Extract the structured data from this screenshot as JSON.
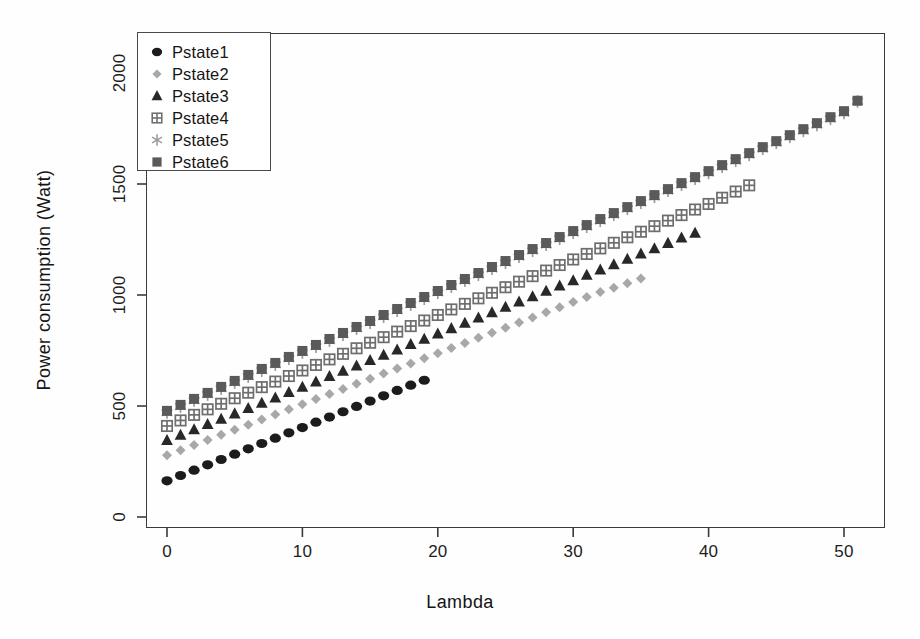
{
  "chart_data": {
    "type": "scatter",
    "title": "",
    "xlabel": "Lambda",
    "ylabel": "Power consumption (Watt)",
    "xlim": [
      -1.8,
      53.8
    ],
    "ylim": [
      -55,
      2105
    ],
    "xticks": [
      0,
      10,
      20,
      30,
      40,
      50
    ],
    "yticks": [
      0,
      500,
      1000,
      1500,
      2000
    ],
    "grid": false,
    "legend_position": "top-left",
    "series": [
      {
        "name": "Pstate1",
        "marker": "filled-circle",
        "color": "#1c1c1c",
        "x": [
          0,
          1,
          2,
          3,
          4,
          5,
          6,
          7,
          8,
          9,
          10,
          11,
          12,
          13,
          14,
          15,
          16,
          17,
          18,
          19
        ],
        "y": [
          163,
          187,
          211,
          235,
          259,
          283,
          307,
          331,
          355,
          379,
          403,
          427,
          450,
          474,
          498,
          522,
          546,
          570,
          594,
          616
        ]
      },
      {
        "name": "Pstate2",
        "marker": "filled-diamond",
        "color": "#a8a8a8",
        "x": [
          0,
          1,
          2,
          3,
          4,
          5,
          6,
          7,
          8,
          9,
          10,
          11,
          12,
          13,
          14,
          15,
          16,
          17,
          18,
          19,
          20,
          21,
          22,
          23,
          24,
          25,
          26,
          27,
          28,
          29,
          30,
          31,
          32,
          33,
          34,
          35
        ],
        "y": [
          278,
          301,
          324,
          347,
          370,
          393,
          416,
          439,
          462,
          485,
          508,
          531,
          554,
          577,
          600,
          623,
          646,
          669,
          692,
          715,
          738,
          761,
          784,
          807,
          830,
          853,
          876,
          899,
          922,
          945,
          968,
          991,
          1014,
          1033,
          1053,
          1074
        ]
      },
      {
        "name": "Pstate3",
        "marker": "filled-triangle",
        "color": "#282828",
        "x": [
          0,
          1,
          2,
          3,
          4,
          5,
          6,
          7,
          8,
          9,
          10,
          11,
          12,
          13,
          14,
          15,
          16,
          17,
          18,
          19,
          20,
          21,
          22,
          23,
          24,
          25,
          26,
          27,
          28,
          29,
          30,
          31,
          32,
          33,
          34,
          35,
          36,
          37,
          38,
          39
        ],
        "y": [
          345,
          369,
          393,
          417,
          441,
          465,
          489,
          513,
          537,
          561,
          585,
          609,
          633,
          657,
          681,
          705,
          729,
          753,
          777,
          801,
          825,
          849,
          873,
          897,
          921,
          945,
          969,
          993,
          1017,
          1041,
          1065,
          1089,
          1113,
          1137,
          1161,
          1185,
          1209,
          1233,
          1257,
          1279
        ]
      },
      {
        "name": "Pstate4",
        "marker": "squared-plus",
        "color": "#6e6e6e",
        "x": [
          0,
          1,
          2,
          3,
          4,
          5,
          6,
          7,
          8,
          9,
          10,
          11,
          12,
          13,
          14,
          15,
          16,
          17,
          18,
          19,
          20,
          21,
          22,
          23,
          24,
          25,
          26,
          27,
          28,
          29,
          30,
          31,
          32,
          33,
          34,
          35,
          36,
          37,
          38,
          39,
          40,
          41,
          42,
          43
        ],
        "y": [
          410,
          435,
          460,
          485,
          510,
          535,
          560,
          585,
          610,
          635,
          660,
          685,
          710,
          735,
          760,
          785,
          810,
          835,
          860,
          885,
          910,
          935,
          960,
          985,
          1010,
          1035,
          1060,
          1085,
          1110,
          1135,
          1160,
          1185,
          1210,
          1235,
          1260,
          1285,
          1310,
          1335,
          1360,
          1385,
          1410,
          1438,
          1466,
          1494
        ]
      },
      {
        "name": "Pstate5",
        "marker": "asterisk",
        "color": "#9c9c9c",
        "x": [
          0,
          1,
          2,
          3,
          4,
          5,
          6,
          7,
          8,
          9,
          10,
          11,
          12,
          13,
          14,
          15,
          16,
          17,
          18,
          19,
          20,
          21,
          22,
          23,
          24,
          25,
          26,
          27,
          28,
          29,
          30,
          31,
          32,
          33,
          34,
          35,
          36,
          37,
          38,
          39,
          40,
          41,
          42,
          43,
          44,
          45,
          46,
          47,
          48,
          49,
          50,
          51
        ],
        "y": [
          470,
          497,
          524,
          551,
          578,
          605,
          632,
          659,
          686,
          713,
          740,
          767,
          794,
          821,
          848,
          875,
          902,
          929,
          956,
          983,
          1010,
          1037,
          1064,
          1091,
          1118,
          1145,
          1172,
          1199,
          1226,
          1253,
          1280,
          1307,
          1334,
          1361,
          1388,
          1415,
          1442,
          1469,
          1496,
          1523,
          1550,
          1577,
          1604,
          1631,
          1658,
          1685,
          1712,
          1739,
          1766,
          1793,
          1820,
          1872
        ]
      },
      {
        "name": "Pstate6",
        "marker": "filled-square",
        "color": "#5a5a5a",
        "x": [
          0,
          1,
          2,
          3,
          4,
          5,
          6,
          7,
          8,
          9,
          10,
          11,
          12,
          13,
          14,
          15,
          16,
          17,
          18,
          19,
          20,
          21,
          22,
          23,
          24,
          25,
          26,
          27,
          28,
          29,
          30,
          31,
          32,
          33,
          34,
          35,
          36,
          37,
          38,
          39,
          40,
          41,
          42,
          43,
          44,
          45,
          46,
          47,
          48,
          49,
          50,
          51
        ],
        "y": [
          478,
          505,
          532,
          559,
          586,
          613,
          640,
          667,
          694,
          721,
          748,
          775,
          802,
          829,
          856,
          883,
          910,
          937,
          964,
          991,
          1018,
          1045,
          1072,
          1099,
          1126,
          1153,
          1180,
          1207,
          1234,
          1261,
          1288,
          1315,
          1342,
          1369,
          1396,
          1423,
          1450,
          1477,
          1504,
          1531,
          1558,
          1585,
          1612,
          1639,
          1666,
          1693,
          1720,
          1747,
          1774,
          1801,
          1828,
          1875
        ]
      }
    ]
  },
  "legend": {
    "entries": [
      {
        "label": "Pstate1"
      },
      {
        "label": "Pstate2"
      },
      {
        "label": "Pstate3"
      },
      {
        "label": "Pstate4"
      },
      {
        "label": "Pstate5"
      },
      {
        "label": "Pstate6"
      }
    ]
  }
}
